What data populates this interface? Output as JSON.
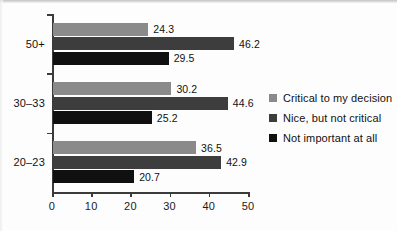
{
  "chart_data": {
    "type": "bar",
    "orientation": "horizontal",
    "title": "",
    "xlabel": "",
    "ylabel": "",
    "categories": [
      "50+",
      "30–33",
      "20–23"
    ],
    "series": [
      {
        "name": "Critical to my decision",
        "color": "#8a8a8a",
        "values": [
          24.3,
          30.2,
          36.5
        ]
      },
      {
        "name": "Nice, but not critical",
        "color": "#3d3d3d",
        "values": [
          46.2,
          44.6,
          42.9
        ]
      },
      {
        "name": "Not important at all",
        "color": "#101010",
        "values": [
          29.5,
          25.2,
          20.7
        ]
      }
    ],
    "xlim": [
      0,
      50
    ],
    "xticks": [
      0,
      10,
      20,
      30,
      40,
      50
    ],
    "xtick_labels": [
      "0",
      "10",
      "20",
      "30",
      "40",
      "50"
    ],
    "grid": false,
    "legend_position": "right",
    "value_labels_shown": true
  }
}
